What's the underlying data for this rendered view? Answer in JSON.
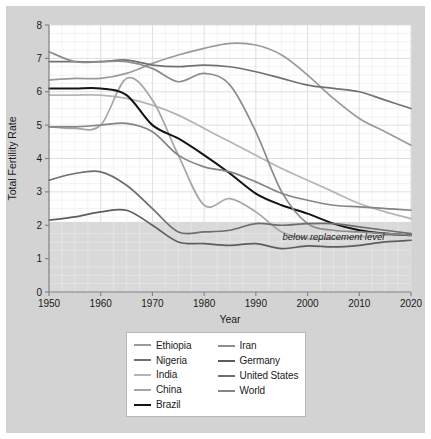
{
  "chart_data": {
    "type": "line",
    "title": "",
    "xlabel": "Year",
    "ylabel": "Total Fertility Rate",
    "xlim": [
      1950,
      2020
    ],
    "ylim": [
      0,
      8
    ],
    "xticks": [
      1950,
      1960,
      1970,
      1980,
      1990,
      2000,
      2010,
      2020
    ],
    "yticks": [
      0,
      1,
      2,
      3,
      4,
      5,
      6,
      7,
      8
    ],
    "grid": true,
    "legend_position": "below-center",
    "annotations": [
      {
        "text": "below replacement level",
        "x": 2005,
        "y": 1.55,
        "style": "italic"
      }
    ],
    "shaded_bands": [
      {
        "label": "below replacement level",
        "y_from": 0,
        "y_to": 2.1,
        "color": "#d9d9d9"
      }
    ],
    "x": [
      1950,
      1955,
      1960,
      1965,
      1970,
      1975,
      1980,
      1985,
      1990,
      1995,
      2000,
      2005,
      2010,
      2015,
      2020
    ],
    "series": [
      {
        "name": "Ethiopia",
        "color": "#9a9a9a",
        "width": 1.7,
        "values": [
          6.35,
          6.4,
          6.4,
          6.55,
          6.85,
          7.1,
          7.3,
          7.45,
          7.4,
          7.1,
          6.5,
          5.8,
          5.2,
          4.8,
          4.4
        ]
      },
      {
        "name": "Nigeria",
        "color": "#717171",
        "width": 1.7,
        "values": [
          6.9,
          6.9,
          6.9,
          6.95,
          6.8,
          6.75,
          6.8,
          6.75,
          6.6,
          6.4,
          6.2,
          6.1,
          6.0,
          5.75,
          5.5
        ]
      },
      {
        "name": "India",
        "color": "#b5b5b5",
        "width": 1.7,
        "values": [
          5.9,
          5.9,
          5.9,
          5.8,
          5.6,
          5.3,
          4.9,
          4.5,
          4.1,
          3.7,
          3.35,
          3.0,
          2.65,
          2.4,
          2.2
        ]
      },
      {
        "name": "China",
        "color": "#a6a6a6",
        "width": 1.7,
        "values": [
          4.95,
          4.9,
          5.0,
          6.4,
          5.75,
          4.1,
          2.6,
          2.8,
          2.4,
          1.8,
          1.6,
          1.6,
          1.65,
          1.7,
          1.7
        ]
      },
      {
        "name": "Brazil",
        "color": "#141414",
        "width": 2.0,
        "values": [
          6.1,
          6.1,
          6.1,
          5.9,
          5.0,
          4.6,
          4.1,
          3.55,
          2.95,
          2.6,
          2.35,
          2.05,
          1.85,
          1.75,
          1.7
        ]
      },
      {
        "name": "Iran",
        "color": "#8d8d8d",
        "width": 1.7,
        "values": [
          7.2,
          6.9,
          6.9,
          6.9,
          6.7,
          6.3,
          6.55,
          6.2,
          4.8,
          3.0,
          2.05,
          1.85,
          1.8,
          1.75,
          1.7
        ]
      },
      {
        "name": "Germany",
        "color": "#5e5e5e",
        "width": 1.7,
        "values": [
          2.15,
          2.25,
          2.4,
          2.45,
          2.0,
          1.5,
          1.45,
          1.4,
          1.45,
          1.3,
          1.38,
          1.35,
          1.4,
          1.5,
          1.55
        ]
      },
      {
        "name": "United States",
        "color": "#6e6e6e",
        "width": 1.7,
        "values": [
          3.35,
          3.55,
          3.6,
          3.2,
          2.5,
          1.8,
          1.8,
          1.85,
          2.05,
          2.0,
          2.05,
          2.05,
          1.95,
          1.85,
          1.75
        ]
      },
      {
        "name": "World",
        "color": "#858585",
        "width": 1.7,
        "values": [
          4.95,
          4.95,
          5.0,
          5.05,
          4.8,
          4.1,
          3.75,
          3.6,
          3.3,
          2.95,
          2.75,
          2.6,
          2.55,
          2.5,
          2.45
        ]
      }
    ]
  },
  "axes": {
    "y_title": "Total Fertility Rate",
    "x_title": "Year",
    "y_tick_labels": [
      "0",
      "1",
      "2",
      "3",
      "4",
      "5",
      "6",
      "7",
      "8"
    ],
    "x_tick_labels": [
      "1950",
      "1960",
      "1970",
      "1980",
      "1990",
      "2000",
      "2010",
      "2020"
    ]
  },
  "annotation": {
    "below_replacement": "below replacement level"
  },
  "legend": {
    "left_column": [
      {
        "label": "Ethiopia",
        "color": "#9a9a9a",
        "width": 1.7
      },
      {
        "label": "Nigeria",
        "color": "#717171",
        "width": 1.7
      },
      {
        "label": "India",
        "color": "#b5b5b5",
        "width": 1.7
      },
      {
        "label": "China",
        "color": "#a6a6a6",
        "width": 1.7
      },
      {
        "label": "Brazil",
        "color": "#141414",
        "width": 2.0
      }
    ],
    "right_column": [
      {
        "label": "Iran",
        "color": "#8d8d8d",
        "width": 1.7
      },
      {
        "label": "Germany",
        "color": "#5e5e5e",
        "width": 1.7
      },
      {
        "label": "United States",
        "color": "#6e6e6e",
        "width": 1.7
      },
      {
        "label": "World",
        "color": "#858585",
        "width": 1.7
      }
    ]
  },
  "colors": {
    "figure_background": "#d3d3d3",
    "plot_background": "#ffffff",
    "grid_major": "#d7dde3",
    "grid_minor": "#e8edf1",
    "axis_line": "#808080",
    "band_fill": "#d9d9d9",
    "legend_background": "#ffffff",
    "legend_border": "#b8b8b8"
  }
}
